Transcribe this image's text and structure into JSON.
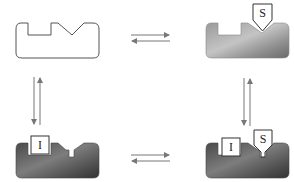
{
  "diagram": {
    "type": "enzyme-inhibitor equilibrium scheme",
    "states": [
      {
        "id": "E",
        "position": "top-left",
        "description": "free enzyme (outline)",
        "labels": []
      },
      {
        "id": "ES",
        "position": "top-right",
        "description": "enzyme with substrate bound",
        "labels": [
          "S"
        ]
      },
      {
        "id": "EI",
        "position": "bottom-left",
        "description": "enzyme with inhibitor bound",
        "labels": [
          "I"
        ]
      },
      {
        "id": "ESI",
        "position": "bottom-right",
        "description": "enzyme with inhibitor and substrate bound",
        "labels": [
          "I",
          "S"
        ]
      }
    ],
    "equilibria": [
      {
        "from": "E",
        "to": "ES",
        "direction": "horizontal",
        "symbol": "⇌"
      },
      {
        "from": "EI",
        "to": "ESI",
        "direction": "horizontal",
        "symbol": "⇌"
      },
      {
        "from": "E",
        "to": "EI",
        "direction": "vertical",
        "symbol": "⇅"
      },
      {
        "from": "ES",
        "to": "ESI",
        "direction": "vertical",
        "symbol": "⇅"
      }
    ],
    "substrate_label": "S",
    "inhibitor_label": "I",
    "colors": {
      "outline": "#555555",
      "es_enzyme_light": "#b8b8b8",
      "es_enzyme_dark": "#6f6f6f",
      "ei_enzyme_light": "#7a7a7a",
      "ei_enzyme_dark": "#3a3a3a",
      "arrow": "#777777",
      "label_box_fill": "#ffffff"
    }
  }
}
